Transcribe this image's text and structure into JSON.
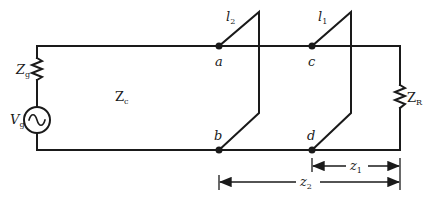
{
  "diagram": {
    "type": "circuit-schematic",
    "colors": {
      "line": "#1a1a1a",
      "background": "#ffffff"
    },
    "labels": {
      "source_impedance": {
        "main": "Z",
        "sub": "g"
      },
      "source_voltage": {
        "main": "V",
        "sub": "g"
      },
      "line_impedance": {
        "main": "Z",
        "sub": "c"
      },
      "load_impedance": {
        "main": "Z",
        "sub": "R"
      },
      "stub2_length": {
        "main": "l",
        "sub": "2"
      },
      "stub1_length": {
        "main": "l",
        "sub": "1"
      },
      "node_a": "a",
      "node_b": "b",
      "node_c": "c",
      "node_d": "d",
      "distance_z1": {
        "main": "z",
        "sub": "1"
      },
      "distance_z2": {
        "main": "z",
        "sub": "2"
      }
    },
    "components": [
      {
        "id": "Zg",
        "kind": "resistor",
        "position": "left-top"
      },
      {
        "id": "Vg",
        "kind": "ac-source",
        "position": "left-bottom"
      },
      {
        "id": "stub2",
        "kind": "shorted-stub",
        "between": [
          "a",
          "b"
        ]
      },
      {
        "id": "stub1",
        "kind": "shorted-stub",
        "between": [
          "c",
          "d"
        ]
      },
      {
        "id": "ZR",
        "kind": "resistor",
        "position": "right"
      }
    ]
  }
}
